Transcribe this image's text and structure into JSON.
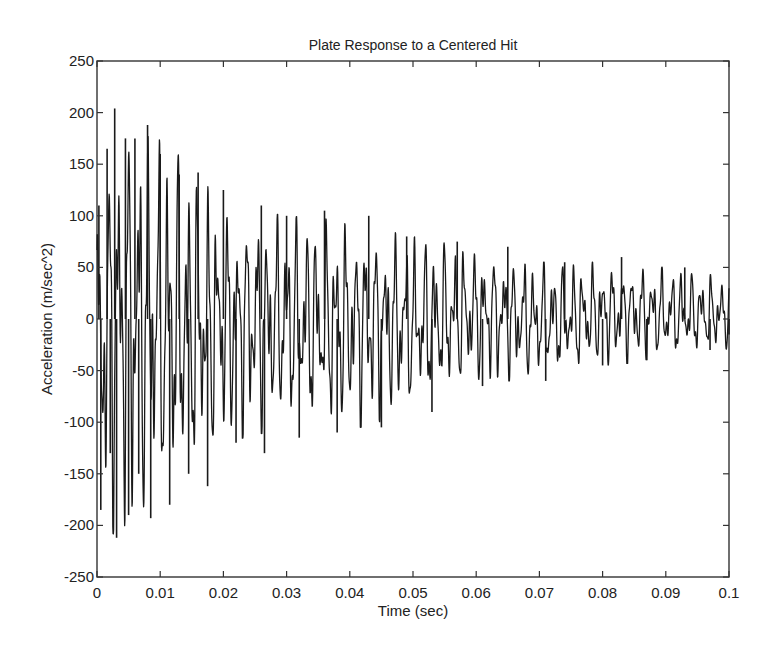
{
  "chart_data": {
    "type": "line",
    "title": "Plate Response to a Centered Hit",
    "xlabel": "Time (sec)",
    "ylabel": "Acceleration (m/sec^2)",
    "xlim": [
      0,
      0.1
    ],
    "ylim": [
      -250,
      250
    ],
    "grid": false,
    "legend": null,
    "x_ticks": [
      0,
      0.01,
      0.02,
      0.03,
      0.04,
      0.05,
      0.06,
      0.07,
      0.08,
      0.09,
      0.1
    ],
    "x_tick_labels": [
      "0",
      "0.01",
      "0.02",
      "0.03",
      "0.04",
      "0.05",
      "0.06",
      "0.07",
      "0.08",
      "0.09",
      "0.1"
    ],
    "y_ticks": [
      250,
      200,
      150,
      100,
      50,
      0,
      -50,
      -100,
      -150,
      -200,
      -250
    ],
    "y_tick_labels": [
      "250",
      "200",
      "150",
      "100",
      "50",
      "0",
      "-50",
      "-100",
      "-150",
      "-200",
      "-250"
    ],
    "series": [
      {
        "name": "acceleration",
        "color": "#1a1a1a",
        "description": "Decaying multi-modal oscillation; peak ~+204 at t≈0.003 s, min ~-212 at t≈0.003 s, decaying to about ±40 by t=0.1 s",
        "envelope": {
          "t": [
            0,
            0.003,
            0.008,
            0.015,
            0.02,
            0.03,
            0.04,
            0.05,
            0.06,
            0.07,
            0.08,
            0.09,
            0.1
          ],
          "upper": [
            110,
            204,
            188,
            150,
            110,
            100,
            95,
            80,
            70,
            55,
            55,
            50,
            40
          ],
          "lower": [
            -185,
            -212,
            -193,
            -160,
            -120,
            -105,
            -108,
            -90,
            -60,
            -60,
            -45,
            -40,
            -30
          ]
        },
        "peaks": [
          {
            "t": 0.0003,
            "a": 110
          },
          {
            "t": 0.0006,
            "a": -185
          },
          {
            "t": 0.0016,
            "a": 165
          },
          {
            "t": 0.0021,
            "a": -130
          },
          {
            "t": 0.0028,
            "a": 204
          },
          {
            "t": 0.0031,
            "a": -212
          },
          {
            "t": 0.0045,
            "a": 175
          },
          {
            "t": 0.005,
            "a": -190
          },
          {
            "t": 0.006,
            "a": 175
          },
          {
            "t": 0.0066,
            "a": -150
          },
          {
            "t": 0.008,
            "a": 188
          },
          {
            "t": 0.0085,
            "a": -193
          },
          {
            "t": 0.01,
            "a": 160
          },
          {
            "t": 0.0115,
            "a": -180
          },
          {
            "t": 0.013,
            "a": 140
          },
          {
            "t": 0.0145,
            "a": -150
          },
          {
            "t": 0.016,
            "a": 142
          },
          {
            "t": 0.0175,
            "a": -162
          },
          {
            "t": 0.02,
            "a": 125
          },
          {
            "t": 0.022,
            "a": -120
          },
          {
            "t": 0.026,
            "a": 110
          },
          {
            "t": 0.0265,
            "a": -130
          },
          {
            "t": 0.03,
            "a": 100
          },
          {
            "t": 0.032,
            "a": -115
          },
          {
            "t": 0.036,
            "a": 105
          },
          {
            "t": 0.038,
            "a": -110
          },
          {
            "t": 0.043,
            "a": 100
          },
          {
            "t": 0.045,
            "a": -105
          },
          {
            "t": 0.049,
            "a": 80
          },
          {
            "t": 0.053,
            "a": -90
          },
          {
            "t": 0.057,
            "a": 75
          },
          {
            "t": 0.061,
            "a": -65
          },
          {
            "t": 0.065,
            "a": 70
          },
          {
            "t": 0.071,
            "a": -60
          },
          {
            "t": 0.074,
            "a": 55
          },
          {
            "t": 0.08,
            "a": -45
          },
          {
            "t": 0.083,
            "a": 60
          },
          {
            "t": 0.087,
            "a": -40
          },
          {
            "t": 0.093,
            "a": 50
          },
          {
            "t": 0.097,
            "a": -30
          },
          {
            "t": 0.1,
            "a": -15
          }
        ]
      }
    ]
  }
}
